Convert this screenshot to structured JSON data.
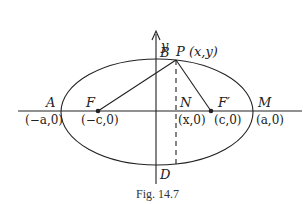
{
  "figure": {
    "caption": "Fig. 14.7",
    "axes": {
      "x_label": "",
      "y_label": "y"
    },
    "points": {
      "A": {
        "label": "A",
        "coord": "(−a,0)"
      },
      "F": {
        "label": "F",
        "coord": "(−c,0)"
      },
      "N": {
        "label": "N",
        "coord": "(x,0)"
      },
      "F_prime": {
        "label": "F′",
        "coord": "(c,0)"
      },
      "M": {
        "label": "M",
        "coord": "(a,0)"
      },
      "B": {
        "label": "B"
      },
      "D": {
        "label": "D"
      },
      "P": {
        "label": "P (x,y)"
      }
    },
    "colors": {
      "stroke": "#222222",
      "background": "#ffffff"
    }
  }
}
